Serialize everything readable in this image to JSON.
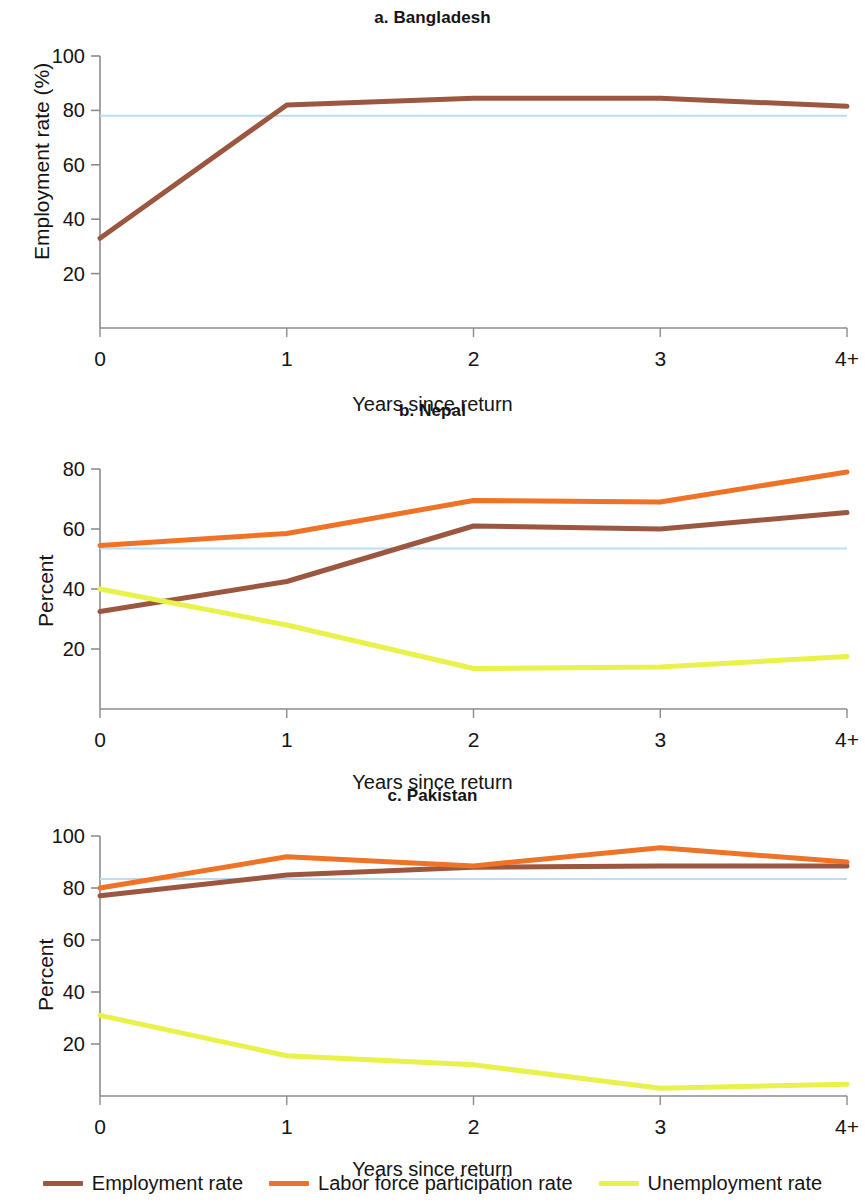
{
  "figure": {
    "xlabel": "Years since return",
    "xticks": [
      "0",
      "1",
      "2",
      "3",
      "4+"
    ]
  },
  "legend": {
    "items": [
      {
        "label": "Employment rate",
        "color": "#9C5741"
      },
      {
        "label": "Labor force participation rate",
        "color": "#EE7326"
      },
      {
        "label": "Unemployment rate",
        "color": "#E9F24A"
      }
    ]
  },
  "colors": {
    "employment": "#9C5741",
    "lfp": "#EE7326",
    "unemployment": "#E9F24A",
    "reference_line": "#BBDDF2",
    "axis": "#8c8c8c"
  },
  "chart_data": [
    {
      "type": "line",
      "title": "a. Bangladesh",
      "xlabel": "Years since return",
      "ylabel": "Employment rate (%)",
      "x": [
        "0",
        "1",
        "2",
        "3",
        "4+"
      ],
      "ylim": [
        0,
        100
      ],
      "yticks": [
        20,
        40,
        60,
        80,
        100
      ],
      "grid": false,
      "legend_position": "figure-bottom",
      "reference_line": 78,
      "series": [
        {
          "name": "Employment rate",
          "color": "#9C5741",
          "values": [
            33,
            82,
            84.5,
            84.5,
            81.5
          ]
        }
      ]
    },
    {
      "type": "line",
      "title": "b. Nepal",
      "xlabel": "Years since return",
      "ylabel": "Percent",
      "x": [
        "0",
        "1",
        "2",
        "3",
        "4+"
      ],
      "ylim": [
        0,
        80
      ],
      "yticks": [
        20,
        40,
        60,
        80
      ],
      "grid": false,
      "legend_position": "figure-bottom",
      "reference_line": 53.5,
      "series": [
        {
          "name": "Employment rate",
          "color": "#9C5741",
          "values": [
            32.5,
            42.5,
            61,
            60,
            65.5
          ]
        },
        {
          "name": "Labor force participation rate",
          "color": "#EE7326",
          "values": [
            54.5,
            58.5,
            69.5,
            69,
            79
          ]
        },
        {
          "name": "Unemployment rate",
          "color": "#E9F24A",
          "values": [
            40,
            28,
            13.5,
            14,
            17.5
          ]
        }
      ]
    },
    {
      "type": "line",
      "title": "c. Pakistan",
      "xlabel": "Years since return",
      "ylabel": "Percent",
      "x": [
        "0",
        "1",
        "2",
        "3",
        "4+"
      ],
      "ylim": [
        0,
        100
      ],
      "yticks": [
        20,
        40,
        60,
        80,
        100
      ],
      "grid": false,
      "legend_position": "figure-bottom",
      "reference_line": 83.5,
      "series": [
        {
          "name": "Employment rate",
          "color": "#9C5741",
          "values": [
            77,
            85,
            88,
            88.5,
            88.5
          ]
        },
        {
          "name": "Labor force participation rate",
          "color": "#EE7326",
          "values": [
            80,
            92,
            88.5,
            95.5,
            90
          ]
        },
        {
          "name": "Unemployment rate",
          "color": "#E9F24A",
          "values": [
            31,
            15.5,
            12,
            3,
            4.5
          ]
        }
      ]
    }
  ]
}
